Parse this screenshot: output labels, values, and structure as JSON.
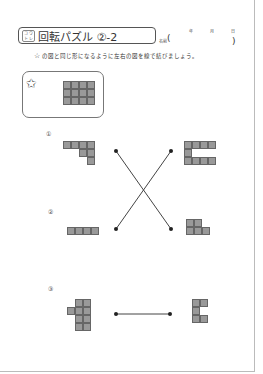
{
  "header": {
    "badge_chars": [
      "コ",
      "ウ",
      "ト",
      "レ"
    ],
    "title": "回転パズル ②-2",
    "name_label": "名前",
    "paren_open": "(",
    "paren_close": ")",
    "date": {
      "year": "年",
      "month": "月",
      "day": "日"
    }
  },
  "instruction": {
    "star": "☆",
    "text": "の図と同じ形になるように左右の図を線で結びましょう。"
  },
  "example": {
    "star": "✩",
    "grid": {
      "cols": 4,
      "rows": 3
    }
  },
  "problems": [
    {
      "number": "①"
    },
    {
      "number": "②"
    },
    {
      "number": "③"
    }
  ],
  "colors": {
    "cell_fill": "#999999",
    "cell_border": "#666666",
    "line": "#444444"
  }
}
